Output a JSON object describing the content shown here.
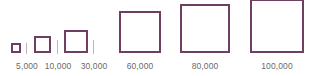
{
  "legend": {
    "type": "size-legend",
    "shape": "square",
    "stroke_color": "#6e3f60",
    "items": [
      {
        "label": "5,000",
        "value": 5000
      },
      {
        "label": "10,000",
        "value": 10000
      },
      {
        "label": "30,000",
        "value": 30000
      },
      {
        "label": "60,000",
        "value": 60000
      },
      {
        "label": "80,000",
        "value": 80000
      },
      {
        "label": "100,000",
        "value": 100000
      }
    ]
  }
}
